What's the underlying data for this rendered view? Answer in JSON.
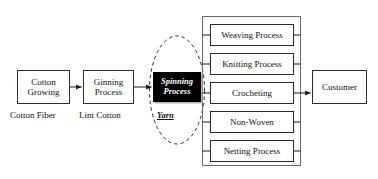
{
  "diagram": {
    "type": "process-flow",
    "colors": {
      "stroke": "#2b2b2b",
      "text": "#111111",
      "highlight_fill": "#000000",
      "highlight_text": "#ffffff",
      "background": "#ffffff",
      "shadow": "#b4b4b4"
    },
    "nodes": {
      "cotton_growing": "Cotton\nGrowing",
      "ginning_process": "Ginning\nProcess",
      "spinning_process": "Spinning\nProcess",
      "customer": "Customer"
    },
    "fabrication_processes": [
      {
        "label": "Weaving Process"
      },
      {
        "label": "Knitting Process"
      },
      {
        "label": "Crocheting"
      },
      {
        "label": "Non-Woven"
      },
      {
        "label": "Netting Process"
      }
    ],
    "captions": {
      "cotton_fiber": "Cotton Fiber",
      "lint_cotton": "Lint Cotton",
      "yarn": "Yarn"
    }
  }
}
